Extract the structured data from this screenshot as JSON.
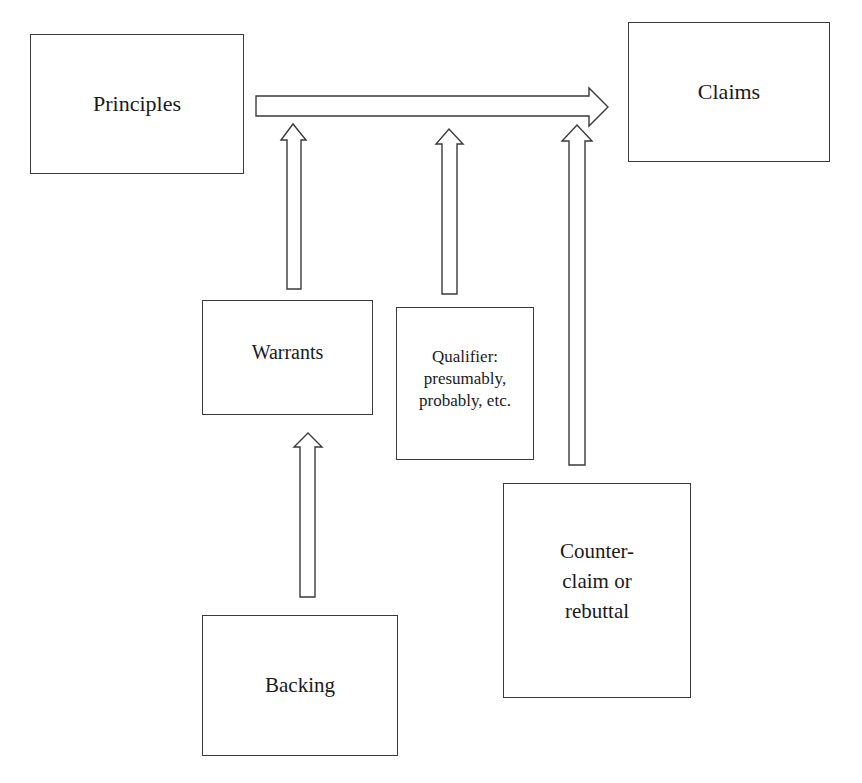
{
  "diagram": {
    "type": "argument-model (Toulmin)",
    "nodes": {
      "principles": {
        "label": "Principles"
      },
      "claims": {
        "label": "Claims"
      },
      "warrants": {
        "label": "Warrants"
      },
      "qualifier": {
        "label": "Qualifier:\npresumably,\nprobably, etc."
      },
      "counterclaim": {
        "label": "Counter-\nclaim or\nrebuttal"
      },
      "backing": {
        "label": "Backing"
      }
    },
    "edges": [
      {
        "from": "principles",
        "to": "claims",
        "style": "hollow-block-arrow",
        "direction": "right"
      },
      {
        "from": "warrants",
        "to": "principles-claims-arrow",
        "style": "hollow-block-arrow",
        "direction": "up"
      },
      {
        "from": "qualifier",
        "to": "principles-claims-arrow",
        "style": "hollow-block-arrow",
        "direction": "up"
      },
      {
        "from": "counterclaim",
        "to": "principles-claims-arrow",
        "style": "hollow-block-arrow",
        "direction": "up"
      },
      {
        "from": "backing",
        "to": "warrants",
        "style": "hollow-block-arrow",
        "direction": "up"
      }
    ],
    "colors": {
      "stroke": "#3a3a3a",
      "fill": "#ffffff",
      "text": "#1a1a1a",
      "background": "#ffffff"
    }
  }
}
